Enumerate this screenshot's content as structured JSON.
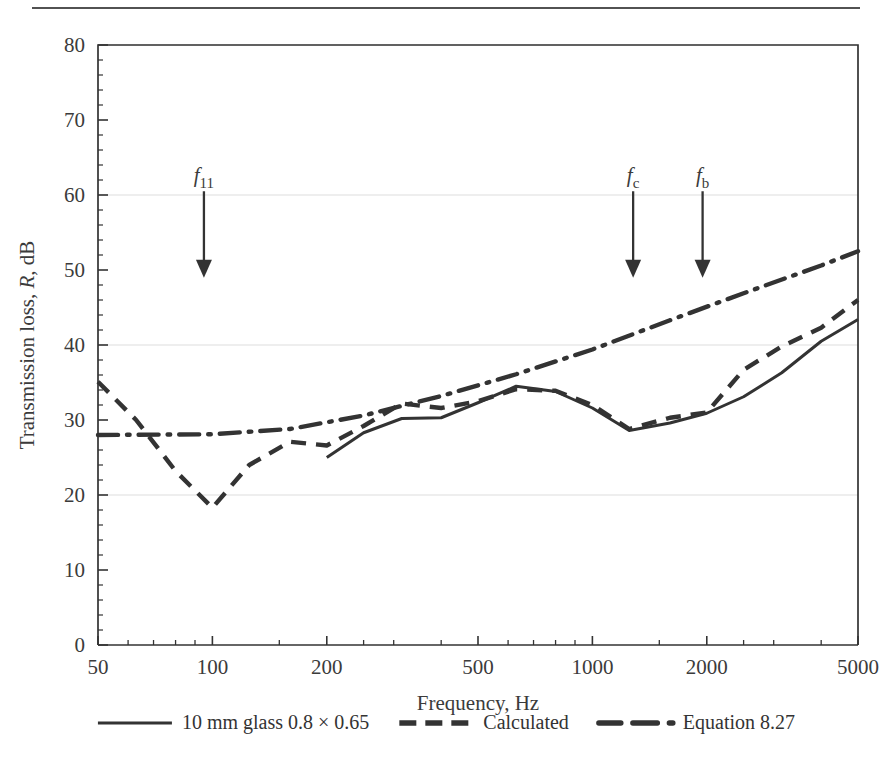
{
  "figure": {
    "background_color": "#ffffff",
    "ink_color": "#333333",
    "grid_color": "#e9e9e9",
    "has_top_rule": true
  },
  "chart_data": {
    "type": "line",
    "title": "",
    "xlabel": "Frequency, Hz",
    "ylabel": "Transmission loss, R, dB",
    "ylabel_parts": {
      "pre": "Transmission loss, ",
      "italic": "R",
      "post": ", dB"
    },
    "xscale": "log",
    "xlim": [
      50,
      5000
    ],
    "ylim": [
      0,
      80
    ],
    "grid": true,
    "grid_y_values": [
      20,
      40,
      60,
      80
    ],
    "xticks": [
      50,
      100,
      200,
      500,
      1000,
      2000,
      5000
    ],
    "xtick_labels": [
      "50",
      "100",
      "200",
      "500",
      "1000",
      "2000",
      "5000"
    ],
    "x_minor_ticks": [
      60,
      70,
      80,
      90,
      150,
      250,
      300,
      400,
      600,
      700,
      800,
      900,
      1500,
      2500,
      3000,
      4000
    ],
    "yticks": [
      0,
      10,
      20,
      30,
      40,
      50,
      60,
      70,
      80
    ],
    "ytick_labels": [
      "0",
      "10",
      "20",
      "30",
      "40",
      "50",
      "60",
      "70",
      "80"
    ],
    "y_minor_step": 2,
    "legend_position": "below-axes",
    "series": [
      {
        "name": "10 mm glass 0.8 × 0.65",
        "style": "solid",
        "x": [
          200,
          250,
          315,
          400,
          500,
          630,
          800,
          1000,
          1250,
          1600,
          2000,
          2500,
          3150,
          4000,
          5000
        ],
        "y": [
          25.0,
          28.3,
          30.2,
          30.3,
          32.3,
          34.5,
          33.8,
          31.6,
          28.6,
          29.6,
          30.9,
          33.1,
          36.3,
          40.5,
          43.4
        ]
      },
      {
        "name": "Calculated",
        "style": "dashed",
        "x": [
          50,
          63,
          80,
          100,
          125,
          160,
          200,
          250,
          315,
          400,
          500,
          630,
          800,
          1000,
          1250,
          1600,
          2000,
          2500,
          3150,
          4000,
          5000
        ],
        "y": [
          35.1,
          30.0,
          23.2,
          18.3,
          24.0,
          27.1,
          26.6,
          29.2,
          32.2,
          31.6,
          32.5,
          34.1,
          33.9,
          32.0,
          28.8,
          30.3,
          31.0,
          36.7,
          39.8,
          42.3,
          46.0
        ]
      },
      {
        "name": "Equation 8.27",
        "style": "dashdot",
        "x": [
          50,
          100,
          160,
          250,
          400,
          630,
          1000,
          1600,
          2500,
          4000,
          5000
        ],
        "y": [
          28.0,
          28.1,
          28.8,
          30.6,
          33.2,
          36.1,
          39.4,
          43.3,
          46.9,
          50.6,
          52.5
        ]
      }
    ],
    "annotations": [
      {
        "label": "f11",
        "label_base": "f",
        "label_sub": "11",
        "x": 95,
        "y_tail": 60.5,
        "y_head": 49.5
      },
      {
        "label": "fc",
        "label_base": "f",
        "label_sub": "c",
        "x": 1280,
        "y_tail": 60.5,
        "y_head": 49.5
      },
      {
        "label": "fb",
        "label_base": "f",
        "label_sub": "b",
        "x": 1950,
        "y_tail": 60.5,
        "y_head": 49.5
      }
    ]
  },
  "legend": {
    "items": [
      {
        "label": "10 mm glass 0.8 × 0.65",
        "style": "solid"
      },
      {
        "label": "Calculated",
        "style": "dashed"
      },
      {
        "label": "Equation 8.27",
        "style": "dashdot"
      }
    ]
  }
}
